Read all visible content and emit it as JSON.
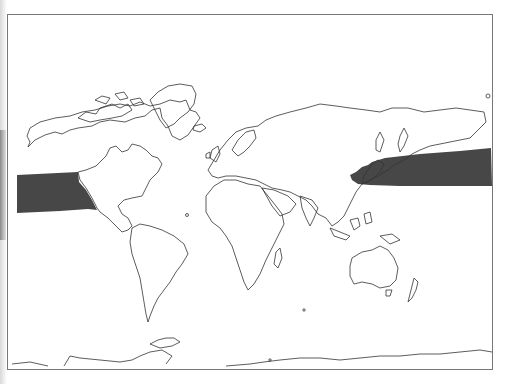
{
  "map": {
    "type": "world-outline-distribution-map",
    "projection": "equirectangular",
    "colors": {
      "background": "#ffffff",
      "coastline": "#333333",
      "frame": "#777777",
      "range_fill": "#474747"
    },
    "highlighted_region": {
      "description": "North Pacific band from Japan / East Asia coast across to western North America (Baja California)",
      "segments": [
        "western-pacific-japan-to-dateline",
        "eastern-pacific-to-north-america-coast"
      ]
    },
    "labels": []
  }
}
